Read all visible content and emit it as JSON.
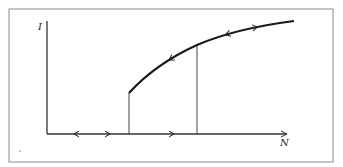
{
  "figure": {
    "type": "hysteresis-diagram",
    "frame": {
      "x": 9,
      "y": 9,
      "width": 324,
      "height": 153,
      "stroke": "#8a8a8a"
    },
    "axes": {
      "origin": [
        47,
        134
      ],
      "x_end": 287,
      "y_top": 21,
      "x_label": "N",
      "y_label": "I",
      "x_label_pos": [
        280,
        146
      ],
      "y_label_pos": [
        38,
        30
      ],
      "stroke": "#333333"
    },
    "curve": {
      "description": "upper branch (stable nonzero state)",
      "path": "M129,93 C150,70 175,55 197,45 C225,33 255,26 294,21",
      "stroke": "#1a1a1a",
      "arrows": [
        {
          "direction": "left",
          "x": 170,
          "y": 58
        },
        {
          "direction": "left",
          "x": 227,
          "y": 34
        },
        {
          "direction": "right",
          "x": 256,
          "y": 28
        }
      ]
    },
    "jump_lines": [
      {
        "name": "lower-threshold",
        "x": 129,
        "y_from": 134,
        "y_to": 93
      },
      {
        "name": "upper-threshold",
        "x": 197,
        "y_from": 134,
        "y_to": 45
      }
    ],
    "baseline_arrows": [
      {
        "direction": "left",
        "x": 76,
        "y": 134
      },
      {
        "direction": "right",
        "x": 108,
        "y": 134
      },
      {
        "direction": "right",
        "x": 172,
        "y": 134
      }
    ],
    "stray_mark": {
      "x": 20,
      "y": 151
    }
  }
}
